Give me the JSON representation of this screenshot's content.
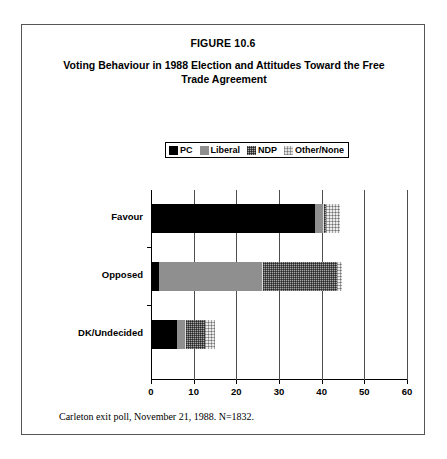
{
  "figure": {
    "number": "FIGURE 10.6",
    "title": "Voting Behaviour in 1988 Election and Attitudes Toward the Free Trade Agreement",
    "footnote": "Carleton exit poll, November 21, 1988. N=1832."
  },
  "legend": {
    "entries": [
      {
        "label": "PC",
        "swatch": "pc-swatch",
        "color": "#000000"
      },
      {
        "label": "Liberal",
        "swatch": "liberal-swatch",
        "color": "#8f8f8f"
      },
      {
        "label": "NDP",
        "swatch": "ndp-swatch",
        "color": "#a6a6a6"
      },
      {
        "label": "Other/None",
        "swatch": "other-none-swatch",
        "color": "#ededed"
      }
    ]
  },
  "chart_data": {
    "type": "bar",
    "orientation": "horizontal",
    "stacked": true,
    "title": "Voting Behaviour in 1988 Election and Attitudes Toward the Free Trade Agreement",
    "xlabel": "",
    "ylabel": "",
    "xlim": [
      0,
      60
    ],
    "xticks": [
      0,
      10,
      20,
      30,
      40,
      50,
      60
    ],
    "xticklabels": [
      "0",
      "10",
      "20",
      "30",
      "40",
      "50",
      "60"
    ],
    "grid": "vertical",
    "legend_position": "top-center",
    "categories": [
      "Favour",
      "Opposed",
      "DK/Undecided"
    ],
    "series": [
      {
        "name": "PC",
        "values": [
          38.5,
          1.9,
          6.0
        ]
      },
      {
        "name": "Liberal",
        "values": [
          1.7,
          24.1,
          2.0
        ]
      },
      {
        "name": "NDP",
        "values": [
          0.8,
          17.6,
          4.7
        ]
      },
      {
        "name": "Other/None",
        "values": [
          3.3,
          1.2,
          2.3
        ]
      }
    ],
    "totals": [
      44.3,
      44.8,
      15.0
    ]
  }
}
